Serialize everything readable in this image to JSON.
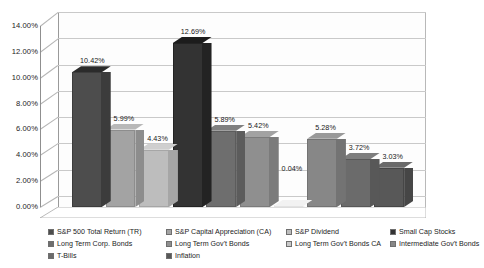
{
  "chart_data": {
    "type": "bar",
    "title": "",
    "xlabel": "",
    "ylabel": "",
    "ylim": [
      0,
      14
    ],
    "ytick_values": [
      14,
      12,
      10,
      8,
      6,
      4,
      2,
      0
    ],
    "ytick_labels": [
      "14.00%",
      "12.00%",
      "10.00%",
      "8.00%",
      "6.00%",
      "4.00%",
      "2.00%",
      "0.00%"
    ],
    "grid": true,
    "legend_position": "bottom",
    "three_d": true,
    "categories": [
      "S&P 500 Total Return (TR)",
      "S&P Capital Appreciation (CA)",
      "S&P Dividend",
      "Small Cap Stocks",
      "Long Term Corp. Bonds",
      "Long Term Gov't Bonds",
      "Long Term Gov't Bonds CA",
      "Intermediate Gov't Bonds",
      "T-Bills",
      "Inflation"
    ],
    "values": [
      10.42,
      5.99,
      4.43,
      12.69,
      5.89,
      5.42,
      0.04,
      5.28,
      3.72,
      3.03
    ],
    "data_labels": [
      "10.42%",
      "5.99%",
      "4.43%",
      "12.69%",
      "5.89%",
      "5.42%",
      "0.04%",
      "5.28%",
      "3.72%",
      "3.03%"
    ],
    "colors": [
      "#4d4d4d",
      "#a3a3a3",
      "#bdbdbd",
      "#333333",
      "#6e6e6e",
      "#8f8f8f",
      "#ffffff",
      "#878787",
      "#6b6b6b",
      "#585858"
    ],
    "side_colors": [
      "#3c3c3c",
      "#8d8d8d",
      "#a6a6a6",
      "#232323",
      "#5c5c5c",
      "#7b7b7b",
      "#e2e2e2",
      "#737373",
      "#585858",
      "#464646"
    ],
    "top_colors": [
      "#2b2b2b",
      "#b8b8b8",
      "#cfcfcf",
      "#1c1c1c",
      "#808080",
      "#a2a2a2",
      "#f2f2f2",
      "#999999",
      "#7d7d7d",
      "#6a6a6a"
    ]
  },
  "legend": {
    "items": [
      {
        "label": "S&P 500 Total Return (TR)",
        "color": "#4d4d4d"
      },
      {
        "label": "S&P Capital Appreciation (CA)",
        "color": "#a3a3a3"
      },
      {
        "label": "S&P Dividend",
        "color": "#bdbdbd"
      },
      {
        "label": "Small Cap Stocks",
        "color": "#333333"
      },
      {
        "label": "Long Term Corp. Bonds",
        "color": "#6e6e6e"
      },
      {
        "label": "Long Term Gov't Bonds",
        "color": "#8f8f8f"
      },
      {
        "label": "Long Term Gov't Bonds CA",
        "color": "#c9c9c9"
      },
      {
        "label": "Intermediate Gov't Bonds",
        "color": "#878787"
      },
      {
        "label": "T-Bills",
        "color": "#6b6b6b"
      },
      {
        "label": "Inflation",
        "color": "#585858"
      }
    ]
  },
  "style": {
    "background": "#ffffff",
    "gridline_color": "#c9c9c9",
    "axis_color": "#8f8f8f",
    "text_color": "#1c1c1c"
  }
}
